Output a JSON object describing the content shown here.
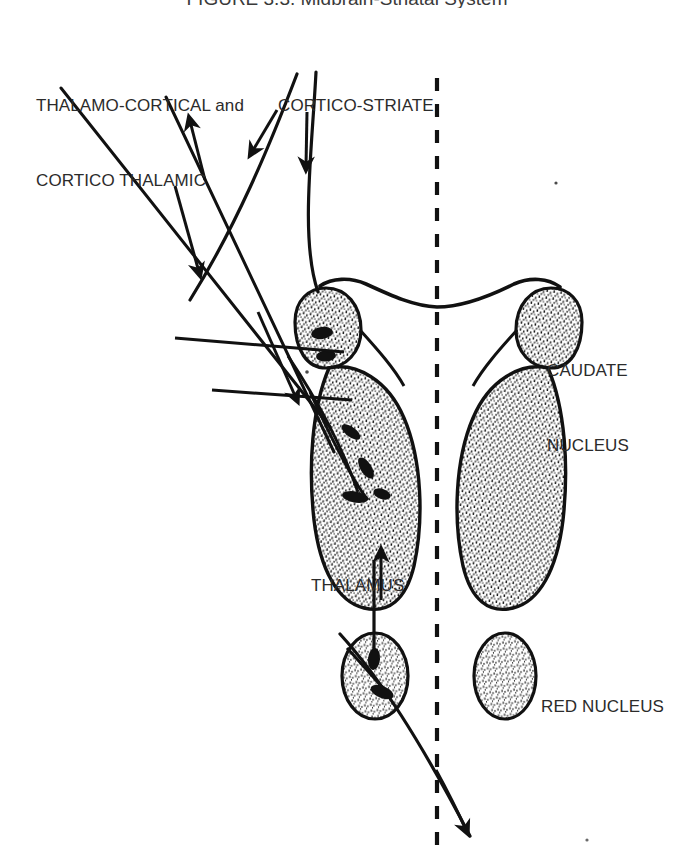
{
  "figure": {
    "title": "FIGURE 3.3. Midbrain-Striatal System",
    "background_color": "#ffffff",
    "ink_color": "#111111",
    "text_color": "#2b2b2b",
    "width": 694,
    "height": 865
  },
  "labels": {
    "thalamo_cortical": {
      "line1": "THALAMO-CORTICAL and",
      "line2": "CORTICO THALAMIC"
    },
    "cortico_striate": {
      "line1": "CORTICO-STRIATE"
    },
    "caudate_nucleus": {
      "line1": "CAUDATE",
      "line2": "NUCLEUS"
    },
    "thalamus": {
      "line1": "THALAMUS"
    },
    "red_nucleus": {
      "line1": "RED NUCLEUS"
    }
  },
  "structures": [
    {
      "name": "caudate-nucleus-left",
      "type": "stippled-oval",
      "side": "left"
    },
    {
      "name": "caudate-nucleus-right",
      "type": "stippled-oval",
      "side": "right"
    },
    {
      "name": "thalamus-left",
      "type": "stippled-oval",
      "side": "left"
    },
    {
      "name": "thalamus-right",
      "type": "stippled-oval",
      "side": "right"
    },
    {
      "name": "red-nucleus-left",
      "type": "stippled-oval",
      "side": "left"
    },
    {
      "name": "red-nucleus-right",
      "type": "stippled-oval",
      "side": "right"
    },
    {
      "name": "lateral-ventricle-arch",
      "type": "outline-curve",
      "side": "midline"
    },
    {
      "name": "midline",
      "type": "dashed-vertical-line",
      "side": "midline"
    }
  ],
  "pathways": [
    {
      "name": "thalamo-cortical-tract",
      "direction": "ascending",
      "arrow": "up"
    },
    {
      "name": "cortico-thalamic-tract",
      "direction": "descending",
      "arrow": "down"
    },
    {
      "name": "cortico-striate-tract-medial",
      "direction": "descending",
      "arrow": "down"
    },
    {
      "name": "cortico-striate-tract-lateral",
      "direction": "descending",
      "arrow": "down"
    },
    {
      "name": "red-nucleus-to-thalamus-tract",
      "direction": "ascending",
      "arrow": "up"
    },
    {
      "name": "descending-outflow-tract",
      "direction": "descending",
      "arrow": "down"
    }
  ]
}
